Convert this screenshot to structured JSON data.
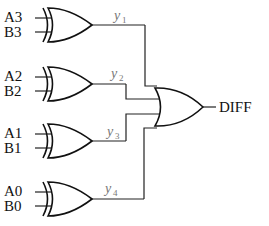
{
  "diagram": {
    "type": "logic-circuit",
    "xor_gates": [
      {
        "id": "xor3",
        "inputs": [
          "A3",
          "B3"
        ],
        "output": {
          "name": "y",
          "sub": "1"
        }
      },
      {
        "id": "xor2",
        "inputs": [
          "A2",
          "B2"
        ],
        "output": {
          "name": "y",
          "sub": "2"
        }
      },
      {
        "id": "xor1",
        "inputs": [
          "A1",
          "B1"
        ],
        "output": {
          "name": "y",
          "sub": "3"
        }
      },
      {
        "id": "xor0",
        "inputs": [
          "A0",
          "B0"
        ],
        "output": {
          "name": "y",
          "sub": "4"
        }
      }
    ],
    "or_gate": {
      "inputs": [
        "y1",
        "y2",
        "y3",
        "y4"
      ],
      "output": "DIFF"
    }
  }
}
